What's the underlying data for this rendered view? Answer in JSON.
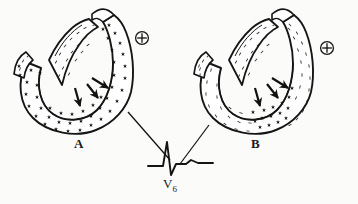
{
  "figure": {
    "type": "anatomical-diagram",
    "background_color": "#fbfbf9",
    "ink_color": "#1a1a1a",
    "panels": [
      {
        "id": "A",
        "letter": "A",
        "electrode_symbol": "⊕",
        "electrode_name": "positive-electrode",
        "wall_pattern": "stars",
        "septum_pattern": "dashes",
        "arrow_count": 3,
        "description": "transmural star stippling through full thickness of left ventricular free wall"
      },
      {
        "id": "B",
        "letter": "B",
        "electrode_symbol": "⊕",
        "electrode_name": "positive-electrode",
        "wall_pattern": "dashes",
        "septum_pattern": "dashes",
        "arrow_count": 3,
        "description": "star stippling confined to subendocardial zone near arrow tips"
      }
    ],
    "ecg": {
      "lead_label": "V",
      "lead_subscript": "6",
      "waveform_name": "qrs-complex",
      "components": [
        "r-wave",
        "s-wave",
        "t-wave"
      ]
    },
    "leader_lines": 2
  }
}
